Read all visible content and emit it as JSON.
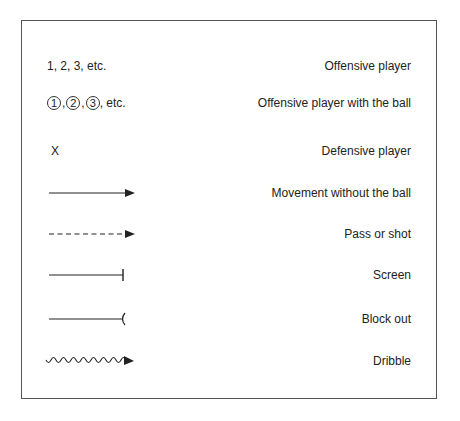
{
  "legend": {
    "rows": [
      {
        "symbol_text": "1, 2, 3, etc.",
        "label": "Offensive player",
        "symbol_type": "numbers-text"
      },
      {
        "symbol_numbers": [
          "1",
          "2",
          "3"
        ],
        "symbol_suffix": ", etc.",
        "label": "Offensive player with the ball",
        "symbol_type": "circled-numbers"
      },
      {
        "symbol_text": "X",
        "label": "Defensive player",
        "symbol_type": "x-mark"
      },
      {
        "label": "Movement without the ball",
        "symbol_type": "solid-arrow-icon"
      },
      {
        "label": "Pass or shot",
        "symbol_type": "dashed-arrow-icon"
      },
      {
        "label": "Screen",
        "symbol_type": "line-with-bar-icon"
      },
      {
        "label": "Block out",
        "symbol_type": "line-with-arc-icon"
      },
      {
        "label": "Dribble",
        "symbol_type": "wavy-arrow-icon"
      }
    ]
  },
  "colors": {
    "line": "#222222",
    "border": "#555555",
    "background": "#ffffff"
  }
}
